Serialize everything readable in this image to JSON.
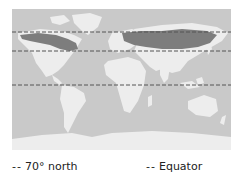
{
  "map": {
    "ocean_color": "#c9c9c9",
    "land_color": "#ededed",
    "highlight_band_color": "#7d7d7d",
    "lines": [
      {
        "id": "70-north",
        "y": 23,
        "label": "70° north"
      },
      {
        "id": "mid-latitude",
        "y": 42
      },
      {
        "id": "equator",
        "y": 76,
        "label": "Equator"
      }
    ]
  },
  "legend": {
    "items": [
      {
        "symbol": "--",
        "label": "70° north"
      },
      {
        "symbol": "--",
        "label": "Equator"
      }
    ]
  }
}
